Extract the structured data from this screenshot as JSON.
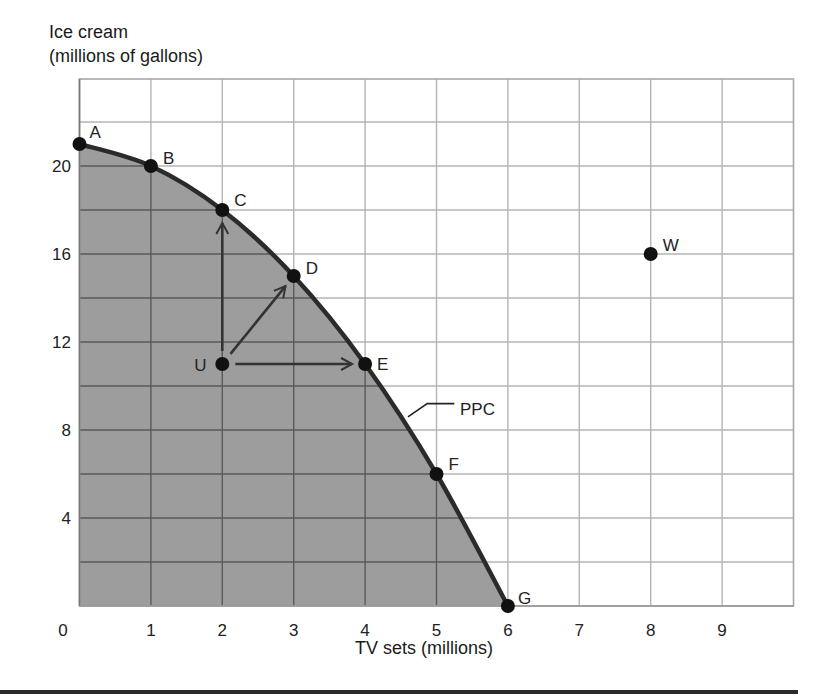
{
  "chart_data": {
    "type": "line",
    "title": "",
    "ylabel_lines": [
      "Ice cream",
      "(millions of gallons)"
    ],
    "xlabel": "TV sets (millions)",
    "x_ticks": [
      0,
      1,
      2,
      3,
      4,
      5,
      6,
      7,
      8,
      9
    ],
    "y_ticks": [
      20,
      16,
      12,
      8,
      4
    ],
    "xlim": [
      0,
      10.2
    ],
    "ylim": [
      0,
      24
    ],
    "grid": true,
    "grid_step_x": 1,
    "grid_step_y": 2,
    "series": [
      {
        "name": "PPC",
        "label": "PPC",
        "shaded_below": true,
        "points": [
          {
            "label": "A",
            "x": 0,
            "y": 21
          },
          {
            "label": "B",
            "x": 1,
            "y": 20
          },
          {
            "label": "C",
            "x": 2,
            "y": 18
          },
          {
            "label": "D",
            "x": 3,
            "y": 15
          },
          {
            "label": "E",
            "x": 4,
            "y": 11
          },
          {
            "label": "F",
            "x": 5,
            "y": 6
          },
          {
            "label": "G",
            "x": 6,
            "y": 0
          }
        ]
      }
    ],
    "extra_points": [
      {
        "label": "U",
        "x": 2,
        "y": 11
      },
      {
        "label": "W",
        "x": 8,
        "y": 16
      }
    ],
    "arrows": [
      {
        "from": "U",
        "to": "C"
      },
      {
        "from": "U",
        "to": "D"
      },
      {
        "from": "U",
        "to": "E"
      }
    ],
    "colors": {
      "shade": "#9d9d9d",
      "grid_light": "#b4b4b4",
      "grid_dark": "#5a5a5a",
      "curve": "#2b2b2b",
      "points": "#111111"
    }
  }
}
